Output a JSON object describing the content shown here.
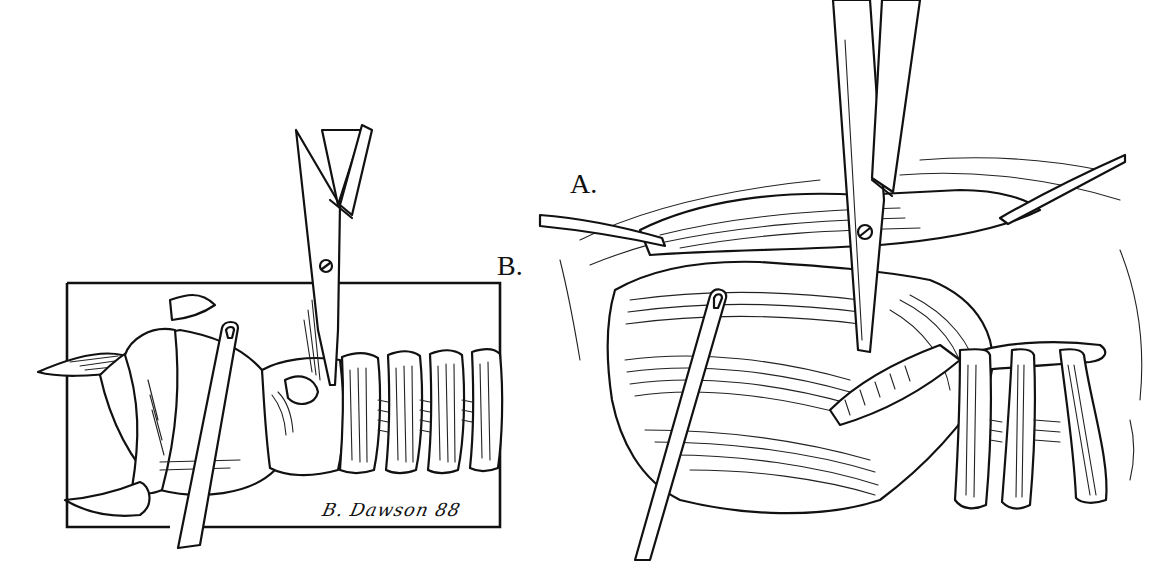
{
  "figure": {
    "panels": [
      {
        "id": "A",
        "label": "A.",
        "content": "Surgical field view: scissors dividing muscle tissue, probe inserted, tracheal rings visible at lower right, retractors at left and upper right"
      },
      {
        "id": "B",
        "label": "B.",
        "content": "Framed lateral view of larynx and trachea with scissors at cricoid level and probe inserted"
      }
    ],
    "signature": "B. Dawson 88",
    "colors": {
      "ink": "#111111",
      "background": "#ffffff"
    }
  }
}
